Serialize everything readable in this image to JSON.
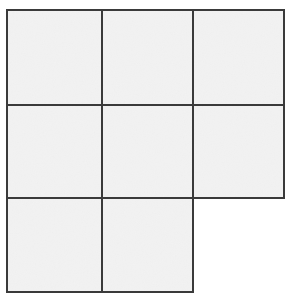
{
  "figure": {
    "type": "line-drawing",
    "canvas": {
      "width": 294,
      "height": 300,
      "background_color": "#ffffff"
    },
    "style": {
      "line_color": "#3a3a3a",
      "line_width": 2.2,
      "cell_fill_color": "#f2f2f2",
      "texture": "subtle-paper-grain"
    },
    "grid": {
      "rows": 3,
      "columns": 3,
      "total_cells_possible": 9,
      "cells_drawn": 8,
      "missing_cells": [
        "row-3-col-3"
      ],
      "x_gridlines": [
        7,
        102,
        193,
        284
      ],
      "y_gridlines": [
        10,
        105,
        198,
        292
      ],
      "column_widths": [
        95,
        91,
        91
      ],
      "row_heights": [
        95,
        93,
        94
      ]
    },
    "cells": [
      {
        "id": "cell-r1c1",
        "row": 1,
        "col": 1,
        "x": 7,
        "y": 10,
        "w": 95,
        "h": 95,
        "present": true,
        "fill": "#f2f2f2"
      },
      {
        "id": "cell-r1c2",
        "row": 1,
        "col": 2,
        "x": 102,
        "y": 10,
        "w": 91,
        "h": 95,
        "present": true,
        "fill": "#f2f2f2"
      },
      {
        "id": "cell-r1c3",
        "row": 1,
        "col": 3,
        "x": 193,
        "y": 10,
        "w": 91,
        "h": 95,
        "present": true,
        "fill": "#f2f2f2"
      },
      {
        "id": "cell-r2c1",
        "row": 2,
        "col": 1,
        "x": 7,
        "y": 105,
        "w": 95,
        "h": 93,
        "present": true,
        "fill": "#f2f2f2"
      },
      {
        "id": "cell-r2c2",
        "row": 2,
        "col": 2,
        "x": 102,
        "y": 105,
        "w": 91,
        "h": 93,
        "present": true,
        "fill": "#f2f2f2"
      },
      {
        "id": "cell-r2c3",
        "row": 2,
        "col": 3,
        "x": 193,
        "y": 105,
        "w": 91,
        "h": 93,
        "present": true,
        "fill": "#f2f2f2"
      },
      {
        "id": "cell-r3c1",
        "row": 3,
        "col": 1,
        "x": 7,
        "y": 198,
        "w": 95,
        "h": 94,
        "present": true,
        "fill": "#f2f2f2"
      },
      {
        "id": "cell-r3c2",
        "row": 3,
        "col": 2,
        "x": 102,
        "y": 198,
        "w": 91,
        "h": 94,
        "present": true,
        "fill": "#f2f2f2"
      },
      {
        "id": "cell-r3c3",
        "row": 3,
        "col": 3,
        "x": 193,
        "y": 198,
        "w": 91,
        "h": 94,
        "present": false,
        "fill": "#ffffff"
      }
    ],
    "strokes": [
      {
        "id": "outline-top",
        "orientation": "horizontal",
        "x1": 7,
        "y1": 10,
        "x2": 284,
        "y2": 10
      },
      {
        "id": "inner-horizontal-1",
        "orientation": "horizontal",
        "x1": 7,
        "y1": 105,
        "x2": 284,
        "y2": 105
      },
      {
        "id": "inner-horizontal-2",
        "orientation": "horizontal",
        "x1": 7,
        "y1": 198,
        "x2": 284,
        "y2": 198
      },
      {
        "id": "outline-bottom",
        "orientation": "horizontal",
        "x1": 7,
        "y1": 292,
        "x2": 193,
        "y2": 292
      },
      {
        "id": "outline-left",
        "orientation": "vertical",
        "x1": 7,
        "y1": 10,
        "x2": 7,
        "y2": 292
      },
      {
        "id": "inner-vertical-1",
        "orientation": "vertical",
        "x1": 102,
        "y1": 10,
        "x2": 102,
        "y2": 292
      },
      {
        "id": "inner-vertical-2",
        "orientation": "vertical",
        "x1": 193,
        "y1": 10,
        "x2": 193,
        "y2": 292
      },
      {
        "id": "outline-right",
        "orientation": "vertical",
        "x1": 284,
        "y1": 10,
        "x2": 284,
        "y2": 198
      }
    ]
  }
}
